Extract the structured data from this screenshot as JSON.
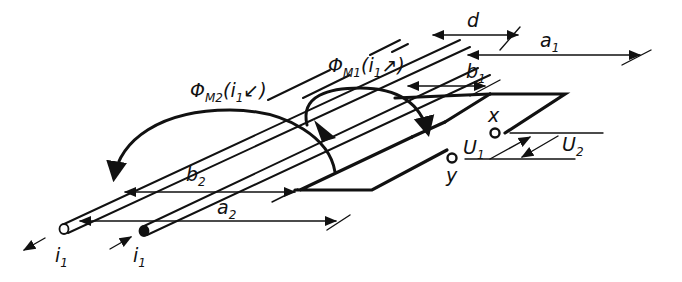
{
  "diagram": {
    "flux_m2": {
      "symbol": "Φ",
      "sub": "M2",
      "arg": "(i",
      "arg_sub": "1",
      "arg_tail": "↙)"
    },
    "flux_m1": {
      "symbol": "Φ",
      "sub": "M1",
      "arg": "(i",
      "arg_sub": "1",
      "arg_tail": "↗)"
    },
    "dimensions": {
      "d": {
        "label": "d"
      },
      "a1": {
        "label": "a",
        "sub": "1"
      },
      "b1": {
        "label": "b",
        "sub": "1"
      },
      "a2": {
        "label": "a",
        "sub": "2"
      },
      "b2": {
        "label": "b",
        "sub": "2"
      }
    },
    "terminals": {
      "x": {
        "label": "x"
      },
      "y": {
        "label": "y"
      }
    },
    "voltages": {
      "u1": {
        "label": "U",
        "sub": "1"
      },
      "u2": {
        "label": "U",
        "sub": "2"
      }
    },
    "currents": {
      "left": {
        "label": "i",
        "sub": "1"
      },
      "right": {
        "label": "i",
        "sub": "1"
      }
    }
  }
}
